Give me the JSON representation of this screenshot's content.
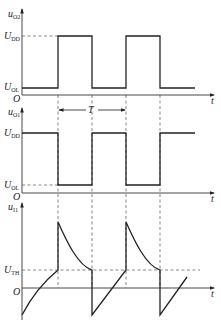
{
  "diagram": {
    "type": "waveform-timing-diagram",
    "panels": [
      {
        "name": "uO2",
        "y_label": {
          "main": "u",
          "sub": "O2"
        },
        "levels": [
          {
            "main": "U",
            "sub": "DD"
          },
          {
            "main": "U",
            "sub": "OL"
          }
        ],
        "origin": "O",
        "x_label": "t",
        "waveform": "square, starts low, high between edges 1-2 and 3-4"
      },
      {
        "name": "uO1",
        "y_label": {
          "main": "u",
          "sub": "O1"
        },
        "levels": [
          {
            "main": "U",
            "sub": "DD"
          },
          {
            "main": "U",
            "sub": "OL"
          }
        ],
        "origin": "O",
        "x_label": "t",
        "period_label": "T",
        "waveform": "square, inverted of uO2"
      },
      {
        "name": "uI1",
        "y_label": {
          "main": "u",
          "sub": "I1"
        },
        "levels": [
          {
            "main": "U",
            "sub": "TH"
          }
        ],
        "origin": "O",
        "x_label": "t",
        "waveform": "charging ramp up to UTH, jumps up, exponential decay to UTH, drops below zero, repeats"
      }
    ]
  }
}
